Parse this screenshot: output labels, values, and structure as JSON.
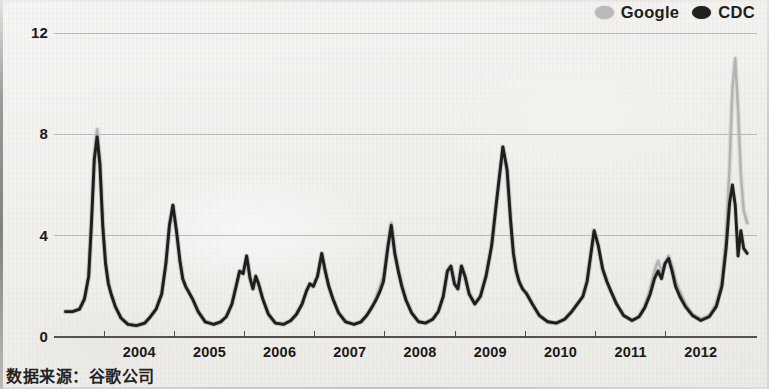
{
  "caption": "数据来源：谷歌公司",
  "legend": {
    "items": [
      {
        "label": "Google",
        "color": "#b9b9b7",
        "marker": "dot-icon"
      },
      {
        "label": "CDC",
        "color": "#20201e",
        "marker": "dot-icon"
      }
    ]
  },
  "chart_data": {
    "type": "line",
    "title": "",
    "subtitle": "",
    "xlabel": "",
    "ylabel": "",
    "source": "数据来源：谷歌公司",
    "grid": true,
    "legend_position": "top-right",
    "xlim": [
      2003.4,
      2013.3
    ],
    "ylim": [
      0,
      12
    ],
    "ytick_labels": [
      "0",
      "4",
      "8",
      "12"
    ],
    "ytick_values": [
      0,
      4,
      8,
      12
    ],
    "xtick_labels": [
      "2004",
      "2005",
      "2006",
      "2007",
      "2008",
      "2009",
      "2010",
      "2011",
      "2012"
    ],
    "xtick_values": [
      2004,
      2005,
      2006,
      2007,
      2008,
      2009,
      2010,
      2011,
      2012
    ],
    "series": [
      {
        "name": "Google",
        "color": "#b0b0ae",
        "x": [
          2003.45,
          2003.55,
          2003.65,
          2003.72,
          2003.78,
          2003.82,
          2003.86,
          2003.9,
          2003.94,
          2003.98,
          2004.02,
          2004.06,
          2004.1,
          2004.16,
          2004.24,
          2004.34,
          2004.46,
          2004.58,
          2004.66,
          2004.74,
          2004.82,
          2004.88,
          2004.93,
          2004.98,
          2005.03,
          2005.08,
          2005.12,
          2005.16,
          2005.2,
          2005.26,
          2005.34,
          2005.44,
          2005.56,
          2005.66,
          2005.74,
          2005.82,
          2005.88,
          2005.93,
          2005.98,
          2006.03,
          2006.08,
          2006.12,
          2006.16,
          2006.2,
          2006.26,
          2006.34,
          2006.44,
          2006.56,
          2006.66,
          2006.74,
          2006.82,
          2006.88,
          2006.93,
          2006.98,
          2007.04,
          2007.1,
          2007.15,
          2007.2,
          2007.26,
          2007.34,
          2007.44,
          2007.56,
          2007.66,
          2007.74,
          2007.82,
          2007.88,
          2007.93,
          2007.98,
          2008.04,
          2008.09,
          2008.14,
          2008.19,
          2008.24,
          2008.3,
          2008.38,
          2008.48,
          2008.58,
          2008.68,
          2008.76,
          2008.83,
          2008.89,
          2008.94,
          2008.99,
          2009.04,
          2009.09,
          2009.14,
          2009.2,
          2009.28,
          2009.36,
          2009.44,
          2009.52,
          2009.6,
          2009.68,
          2009.74,
          2009.79,
          2009.83,
          2009.87,
          2009.91,
          2009.96,
          2010.02,
          2010.1,
          2010.2,
          2010.32,
          2010.44,
          2010.56,
          2010.66,
          2010.74,
          2010.82,
          2010.88,
          2010.93,
          2010.98,
          2011.04,
          2011.1,
          2011.16,
          2011.22,
          2011.3,
          2011.4,
          2011.52,
          2011.62,
          2011.7,
          2011.78,
          2011.84,
          2011.89,
          2011.94,
          2011.99,
          2012.04,
          2012.09,
          2012.14,
          2012.2,
          2012.28,
          2012.38,
          2012.5,
          2012.62,
          2012.72,
          2012.8,
          2012.86,
          2012.91,
          2012.95,
          2012.99,
          2013.03,
          2013.07,
          2013.11,
          2013.16
        ],
        "y": [
          1.0,
          1.0,
          1.1,
          1.5,
          2.4,
          4.6,
          7.1,
          8.2,
          7.0,
          4.6,
          3.0,
          2.2,
          1.7,
          1.2,
          0.75,
          0.5,
          0.45,
          0.55,
          0.8,
          1.1,
          1.7,
          2.9,
          4.4,
          5.2,
          4.2,
          3.0,
          2.3,
          2.0,
          1.8,
          1.5,
          1.0,
          0.6,
          0.5,
          0.6,
          0.8,
          1.3,
          2.0,
          2.6,
          2.5,
          3.2,
          2.3,
          1.9,
          2.4,
          2.1,
          1.5,
          0.9,
          0.55,
          0.5,
          0.65,
          0.9,
          1.3,
          1.8,
          2.1,
          2.0,
          2.4,
          3.3,
          2.6,
          2.0,
          1.5,
          0.95,
          0.6,
          0.5,
          0.6,
          0.85,
          1.2,
          1.6,
          2.0,
          2.4,
          3.6,
          4.5,
          3.4,
          2.7,
          2.1,
          1.5,
          0.95,
          0.6,
          0.55,
          0.7,
          1.0,
          1.6,
          2.6,
          2.8,
          2.1,
          1.9,
          2.8,
          2.4,
          1.7,
          1.3,
          1.6,
          2.4,
          3.6,
          5.6,
          7.5,
          6.6,
          4.6,
          3.3,
          2.6,
          2.2,
          1.9,
          1.7,
          1.3,
          0.85,
          0.6,
          0.55,
          0.7,
          1.0,
          1.3,
          1.6,
          2.2,
          3.2,
          4.2,
          3.6,
          2.7,
          2.2,
          1.8,
          1.3,
          0.85,
          0.65,
          0.8,
          1.2,
          1.9,
          2.6,
          3.0,
          2.6,
          2.9,
          3.2,
          2.8,
          2.2,
          1.8,
          1.3,
          0.9,
          0.7,
          0.85,
          1.3,
          2.2,
          3.9,
          6.8,
          9.8,
          11.0,
          9.0,
          6.4,
          5.0,
          4.5
        ]
      },
      {
        "name": "CDC",
        "color": "#1c1c1a",
        "x": [
          2003.45,
          2003.55,
          2003.65,
          2003.72,
          2003.78,
          2003.82,
          2003.86,
          2003.9,
          2003.94,
          2003.98,
          2004.02,
          2004.06,
          2004.1,
          2004.16,
          2004.24,
          2004.34,
          2004.46,
          2004.58,
          2004.66,
          2004.74,
          2004.82,
          2004.88,
          2004.93,
          2004.98,
          2005.03,
          2005.08,
          2005.12,
          2005.16,
          2005.2,
          2005.26,
          2005.34,
          2005.44,
          2005.56,
          2005.66,
          2005.74,
          2005.82,
          2005.88,
          2005.93,
          2005.98,
          2006.03,
          2006.08,
          2006.12,
          2006.16,
          2006.2,
          2006.26,
          2006.34,
          2006.44,
          2006.56,
          2006.66,
          2006.74,
          2006.82,
          2006.88,
          2006.93,
          2006.98,
          2007.04,
          2007.1,
          2007.15,
          2007.2,
          2007.26,
          2007.34,
          2007.44,
          2007.56,
          2007.66,
          2007.74,
          2007.82,
          2007.88,
          2007.93,
          2007.98,
          2008.04,
          2008.09,
          2008.14,
          2008.19,
          2008.24,
          2008.3,
          2008.38,
          2008.48,
          2008.58,
          2008.68,
          2008.76,
          2008.83,
          2008.89,
          2008.94,
          2008.99,
          2009.04,
          2009.09,
          2009.14,
          2009.2,
          2009.28,
          2009.36,
          2009.44,
          2009.52,
          2009.6,
          2009.68,
          2009.74,
          2009.79,
          2009.83,
          2009.87,
          2009.91,
          2009.96,
          2010.02,
          2010.1,
          2010.2,
          2010.32,
          2010.44,
          2010.56,
          2010.66,
          2010.74,
          2010.82,
          2010.88,
          2010.93,
          2010.98,
          2011.04,
          2011.1,
          2011.16,
          2011.22,
          2011.3,
          2011.4,
          2011.52,
          2011.62,
          2011.7,
          2011.78,
          2011.84,
          2011.89,
          2011.94,
          2011.99,
          2012.04,
          2012.09,
          2012.14,
          2012.2,
          2012.28,
          2012.38,
          2012.5,
          2012.62,
          2012.72,
          2012.8,
          2012.86,
          2012.91,
          2012.95,
          2012.99,
          2013.03,
          2013.07,
          2013.11,
          2013.16
        ],
        "y": [
          1.0,
          1.0,
          1.1,
          1.5,
          2.4,
          4.5,
          7.0,
          7.9,
          6.8,
          4.4,
          2.9,
          2.1,
          1.7,
          1.2,
          0.75,
          0.5,
          0.45,
          0.55,
          0.8,
          1.1,
          1.7,
          2.9,
          4.4,
          5.2,
          4.2,
          3.0,
          2.3,
          2.0,
          1.8,
          1.5,
          1.0,
          0.6,
          0.5,
          0.6,
          0.8,
          1.3,
          2.0,
          2.6,
          2.5,
          3.2,
          2.3,
          1.9,
          2.4,
          2.1,
          1.5,
          0.9,
          0.55,
          0.5,
          0.65,
          0.9,
          1.3,
          1.8,
          2.1,
          2.0,
          2.4,
          3.3,
          2.6,
          2.0,
          1.5,
          0.95,
          0.6,
          0.5,
          0.6,
          0.85,
          1.2,
          1.5,
          1.8,
          2.2,
          3.5,
          4.4,
          3.3,
          2.6,
          2.0,
          1.45,
          0.95,
          0.6,
          0.55,
          0.7,
          1.0,
          1.6,
          2.6,
          2.8,
          2.1,
          1.9,
          2.8,
          2.4,
          1.7,
          1.3,
          1.6,
          2.4,
          3.6,
          5.6,
          7.5,
          6.6,
          4.6,
          3.3,
          2.6,
          2.2,
          1.9,
          1.7,
          1.3,
          0.85,
          0.6,
          0.55,
          0.7,
          1.0,
          1.3,
          1.6,
          2.2,
          3.2,
          4.2,
          3.6,
          2.7,
          2.2,
          1.8,
          1.3,
          0.85,
          0.65,
          0.8,
          1.15,
          1.7,
          2.3,
          2.6,
          2.3,
          2.9,
          3.1,
          2.6,
          2.0,
          1.6,
          1.2,
          0.85,
          0.65,
          0.8,
          1.2,
          2.0,
          3.5,
          5.3,
          6.0,
          5.2,
          3.2,
          4.2,
          3.5,
          3.3
        ]
      }
    ],
    "annotations": [
      {
        "text": "Google overestimates 2012-13 flu peak",
        "x": 2012.99,
        "y": 11.0
      }
    ]
  }
}
